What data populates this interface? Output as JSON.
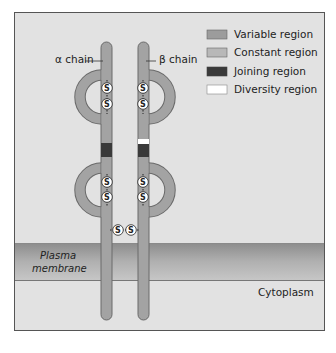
{
  "figure": {
    "chains": [
      {
        "id": "alpha",
        "label": "α chain"
      },
      {
        "id": "beta",
        "label": "β chain"
      }
    ],
    "legend": [
      {
        "label": "Variable region",
        "color": "#9c9c9c"
      },
      {
        "label": "Constant region",
        "color": "#b8b8b8"
      },
      {
        "label": "Joining region",
        "color": "#3a3a3a"
      },
      {
        "label": "Diversity region",
        "color": "#ffffff"
      }
    ],
    "disulfide_symbol": "S",
    "regions": {
      "membrane_line1": "Plasma",
      "membrane_line2": "membrane",
      "cytoplasm": "Cytoplasm"
    },
    "colors": {
      "background": "#e2e2e2",
      "chain_fill": "#a3a3a3",
      "chain_stroke": "#6a6a6a",
      "membrane_dark": "#8a8a8a",
      "membrane_light": "#c4c4c4",
      "frame": "#555555"
    }
  }
}
